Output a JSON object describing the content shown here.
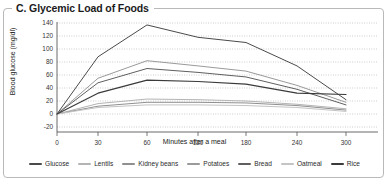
{
  "figure": {
    "panel_label": "C. Glycemic Load of Foods",
    "border_color": "#b9b9b9",
    "background": "#ffffff"
  },
  "chart_data": {
    "type": "line",
    "title": "C. Glycemic Load of Foods",
    "xlabel": "Minutes after a meal",
    "ylabel": "Blood glucose (mg/dl)",
    "x": [
      0,
      30,
      60,
      120,
      180,
      240,
      300
    ],
    "xtick_labels": [
      "0",
      "30",
      "60",
      "120",
      "180",
      "240",
      "300"
    ],
    "ytick_labels": [
      "-20",
      "0",
      "20",
      "40",
      "60",
      "80",
      "100",
      "120",
      "140"
    ],
    "yticks": [
      -20,
      0,
      20,
      40,
      60,
      80,
      100,
      120,
      140
    ],
    "xlim": [
      0,
      300
    ],
    "ylim": [
      -20,
      140
    ],
    "grid": "horizontal-dotted",
    "legend_position": "bottom",
    "series": [
      {
        "name": "Glucose",
        "color": "#4a4a4a",
        "width": 1.0,
        "values": [
          0,
          88,
          137,
          118,
          110,
          74,
          22
        ]
      },
      {
        "name": "Lentils",
        "color": "#b4b4b4",
        "width": 1.0,
        "values": [
          0,
          16,
          23,
          22,
          20,
          15,
          8
        ]
      },
      {
        "name": "Kidney beans",
        "color": "#8f8f8f",
        "width": 1.0,
        "values": [
          0,
          12,
          18,
          18,
          17,
          13,
          6
        ]
      },
      {
        "name": "Potatoes",
        "color": "#9a9a9a",
        "width": 1.0,
        "values": [
          0,
          55,
          82,
          74,
          66,
          44,
          18
        ]
      },
      {
        "name": "Bread",
        "color": "#5f5f5f",
        "width": 1.0,
        "values": [
          0,
          48,
          70,
          64,
          57,
          38,
          14
        ]
      },
      {
        "name": "Oatmeal",
        "color": "#c4c4c4",
        "width": 1.0,
        "values": [
          0,
          10,
          14,
          14,
          13,
          10,
          4
        ]
      },
      {
        "name": "Rice",
        "color": "#3a3a3a",
        "width": 1.2,
        "values": [
          0,
          32,
          52,
          50,
          46,
          32,
          30
        ]
      }
    ]
  }
}
